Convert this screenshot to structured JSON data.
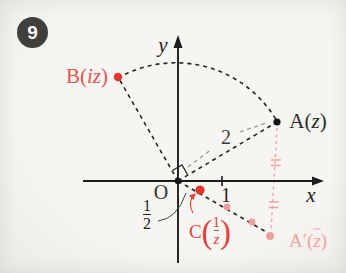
{
  "badge": {
    "number": "9"
  },
  "colors": {
    "red": "#e0443d",
    "pink": "#efa4a2",
    "ink": "#1f1f1f",
    "gray_leader": "#9a9a9a"
  },
  "axes": {
    "x_label": "x",
    "y_label": "y",
    "origin_label": "O",
    "unit_tick_label": "1"
  },
  "annotations": {
    "radius_label": "2",
    "half_fraction": {
      "numerator": "1",
      "denominator": "2"
    }
  },
  "points": {
    "a": {
      "name": "A",
      "open_paren": "(",
      "var": "z",
      "close_paren": ")"
    },
    "b": {
      "name": "B",
      "open_paren": "(",
      "var": "iz",
      "close_paren": ")"
    },
    "c": {
      "name": "C",
      "open_paren": "(",
      "fraction": {
        "numerator": "1",
        "denominator": "z"
      },
      "close_paren": ")"
    },
    "a_conj": {
      "name": "A′",
      "open_paren": "(",
      "var": "z",
      "close_paren": ")"
    }
  }
}
